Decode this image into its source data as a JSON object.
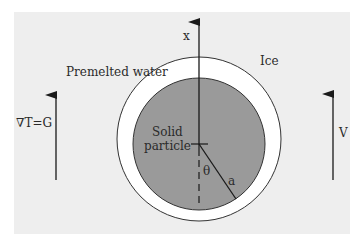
{
  "diagram": {
    "labels": {
      "axis": "x",
      "ice": "Ice",
      "premelted_water": "Premelted water",
      "gradient": "∇T=G",
      "velocity": "V",
      "particle_line1": "Solid",
      "particle_line2": "particle",
      "angle": "θ",
      "radius": "a"
    },
    "colors": {
      "background": "#eeeeee",
      "film": "#ffffff",
      "particle": "#9a9a9a",
      "stroke": "#2a2a2a"
    }
  }
}
